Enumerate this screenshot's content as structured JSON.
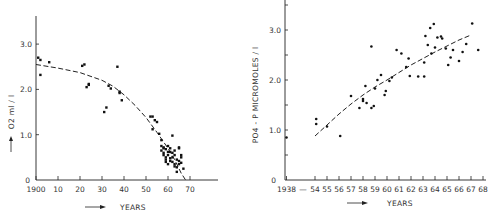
{
  "chart_data": [
    {
      "type": "scatter",
      "title": "",
      "xlabel": "YEARS",
      "ylabel": "O2 ml / l",
      "xlim": [
        1900,
        1980
      ],
      "ylim": [
        0,
        3.5
      ],
      "grid": false,
      "x_ticks": [
        "1900",
        "10",
        "20",
        "30",
        "40",
        "50",
        "60",
        "70"
      ],
      "y_ticks": [
        "0",
        "1.0",
        "2.0",
        "3.0"
      ],
      "trend_line": {
        "style": "dashed",
        "x": [
          1900,
          1910,
          1920,
          1930,
          1935,
          1940,
          1945,
          1950,
          1955,
          1960,
          1963,
          1966,
          1968
        ],
        "y": [
          2.55,
          2.47,
          2.37,
          2.2,
          2.07,
          1.88,
          1.65,
          1.38,
          1.05,
          0.7,
          0.45,
          0.15,
          0.0
        ]
      },
      "points": [
        [
          1901,
          2.7
        ],
        [
          1902,
          2.65
        ],
        [
          1902,
          2.32
        ],
        [
          1906,
          2.6
        ],
        [
          1921,
          2.52
        ],
        [
          1922,
          2.55
        ],
        [
          1923,
          2.05
        ],
        [
          1924,
          2.1
        ],
        [
          1924,
          2.12
        ],
        [
          1931,
          1.5
        ],
        [
          1932,
          1.6
        ],
        [
          1933,
          2.08
        ],
        [
          1934,
          2.02
        ],
        [
          1937,
          2.5
        ],
        [
          1938,
          1.95
        ],
        [
          1938,
          1.92
        ],
        [
          1939,
          1.76
        ],
        [
          1952,
          1.4
        ],
        [
          1953,
          1.4
        ],
        [
          1954,
          1.32
        ],
        [
          1953,
          1.12
        ],
        [
          1955,
          1.28
        ],
        [
          1956,
          1.02
        ],
        [
          1957,
          0.88
        ],
        [
          1957,
          0.75
        ],
        [
          1957,
          0.65
        ],
        [
          1958,
          0.7
        ],
        [
          1958,
          0.6
        ],
        [
          1958,
          0.55
        ],
        [
          1958,
          0.72
        ],
        [
          1959,
          0.68
        ],
        [
          1959,
          0.5
        ],
        [
          1959,
          0.45
        ],
        [
          1959,
          0.4
        ],
        [
          1960,
          0.55
        ],
        [
          1960,
          0.35
        ],
        [
          1960,
          0.62
        ],
        [
          1961,
          0.7
        ],
        [
          1961,
          0.48
        ],
        [
          1961,
          0.42
        ],
        [
          1962,
          0.98
        ],
        [
          1962,
          0.6
        ],
        [
          1962,
          0.5
        ],
        [
          1963,
          0.65
        ],
        [
          1963,
          0.3
        ],
        [
          1963,
          0.55
        ],
        [
          1964,
          0.45
        ],
        [
          1964,
          0.28
        ],
        [
          1964,
          0.18
        ],
        [
          1965,
          0.7
        ],
        [
          1965,
          0.72
        ],
        [
          1965,
          0.42
        ],
        [
          1965,
          0.35
        ],
        [
          1966,
          0.5
        ],
        [
          1966,
          0.38
        ],
        [
          1966,
          0.55
        ],
        [
          1967,
          0.25
        ],
        [
          1960,
          0.75
        ],
        [
          1961,
          0.62
        ],
        [
          1962,
          0.4
        ],
        [
          1963,
          0.35
        ]
      ]
    },
    {
      "type": "scatter",
      "title": "",
      "xlabel": "YEARS",
      "ylabel": "PO4 - P  MICROMOLES / l",
      "ylim": [
        0,
        3.5
      ],
      "grid": false,
      "x_ticks": [
        "1938",
        "—",
        "54",
        "55",
        "56",
        "57",
        "58",
        "59",
        "60",
        "61",
        "62",
        "63",
        "64",
        "65",
        "66",
        "67",
        "68"
      ],
      "y_ticks": [
        "0",
        "1.0",
        "2.0",
        "3.0"
      ],
      "trend_line": {
        "style": "dashed",
        "x": [
          1954.0,
          1955.0,
          1956.0,
          1957.0,
          1958.0,
          1959.0,
          1960.0,
          1961.0,
          1962.0,
          1963.0,
          1964.0,
          1965.0,
          1966.0,
          1967.0
        ],
        "y": [
          0.88,
          1.1,
          1.32,
          1.52,
          1.7,
          1.86,
          2.0,
          2.15,
          2.3,
          2.43,
          2.56,
          2.68,
          2.8,
          2.9
        ]
      },
      "points": [
        [
          1938.0,
          0.85
        ],
        [
          1954.1,
          1.22
        ],
        [
          1954.1,
          1.12
        ],
        [
          1955.0,
          1.07
        ],
        [
          1956.1,
          0.88
        ],
        [
          1957.0,
          1.68
        ],
        [
          1957.7,
          1.44
        ],
        [
          1958.0,
          1.62
        ],
        [
          1958.0,
          1.58
        ],
        [
          1958.2,
          1.88
        ],
        [
          1958.3,
          1.54
        ],
        [
          1958.7,
          1.44
        ],
        [
          1958.7,
          2.67
        ],
        [
          1958.9,
          1.48
        ],
        [
          1959.0,
          1.83
        ],
        [
          1959.2,
          2.0
        ],
        [
          1959.5,
          2.1
        ],
        [
          1959.8,
          1.7
        ],
        [
          1959.9,
          1.78
        ],
        [
          1960.2,
          1.98
        ],
        [
          1960.4,
          2.05
        ],
        [
          1960.8,
          2.6
        ],
        [
          1961.2,
          2.53
        ],
        [
          1961.6,
          2.26
        ],
        [
          1961.8,
          2.43
        ],
        [
          1961.9,
          2.08
        ],
        [
          1962.6,
          2.07
        ],
        [
          1963.1,
          2.35
        ],
        [
          1963.1,
          2.07
        ],
        [
          1963.2,
          2.88
        ],
        [
          1963.4,
          2.7
        ],
        [
          1963.6,
          3.04
        ],
        [
          1963.7,
          2.53
        ],
        [
          1963.9,
          3.12
        ],
        [
          1964.0,
          2.65
        ],
        [
          1964.2,
          2.85
        ],
        [
          1964.5,
          2.87
        ],
        [
          1964.6,
          2.83
        ],
        [
          1964.9,
          2.63
        ],
        [
          1965.1,
          2.3
        ],
        [
          1965.3,
          2.45
        ],
        [
          1965.5,
          2.6
        ],
        [
          1966.0,
          2.38
        ],
        [
          1966.3,
          2.56
        ],
        [
          1966.6,
          2.72
        ],
        [
          1967.1,
          3.13
        ],
        [
          1967.6,
          2.6
        ]
      ]
    }
  ],
  "left_chart": {
    "ylabel": "O2 ml / l",
    "xlabel": "YEARS",
    "y_tick_labels": [
      "0",
      "1.0",
      "2.0",
      "3.0"
    ],
    "x_tick_labels": [
      "1900",
      "10",
      "20",
      "30",
      "40",
      "50",
      "60",
      "70"
    ]
  },
  "right_chart": {
    "ylabel": "PO4 - P   MICROMOLES / l",
    "xlabel": "YEARS",
    "y_tick_labels": [
      "0",
      "1.0",
      "2.0",
      "3.0"
    ],
    "x_tick_labels": [
      "1938",
      "—",
      "54",
      "55",
      "56",
      "57",
      "58",
      "59",
      "60",
      "61",
      "62",
      "63",
      "64",
      "65",
      "66",
      "67",
      "68"
    ]
  }
}
